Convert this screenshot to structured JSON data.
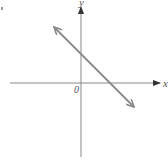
{
  "diagram": {
    "type": "coordinate-plane-line",
    "x_axis_label": "x",
    "y_axis_label": "y",
    "origin_label": "0",
    "line": {
      "description": "straight line with negative slope, arrows at both ends",
      "y_intercept": "positive",
      "x_intercept": "positive",
      "color": "#8a8a8a"
    },
    "axis_color": "#777777"
  }
}
